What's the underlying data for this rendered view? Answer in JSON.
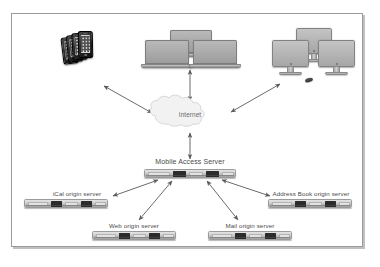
{
  "diagram": {
    "frame": {
      "border_color": "#9a9a9a",
      "background": "#ffffff"
    },
    "colors": {
      "arrow": "#5a5a5a",
      "cloud_fill": "#f2f2f2",
      "cloud_stroke": "#d0d0d0",
      "label_text": "#4a4a4a",
      "rack_dark_bay": "#2b2b2b"
    },
    "cloud": {
      "label": "Internet"
    },
    "mobile_access_server": {
      "label": "Mobile Access Server"
    },
    "clients": [
      {
        "name": "smartphone-stack",
        "icon": "smartphone-stack-icon",
        "count": 4
      },
      {
        "name": "laptop-group",
        "icon": "laptop-icon",
        "count": 3
      },
      {
        "name": "desktop-group",
        "icon": "imac-desktop-icon",
        "count": 3
      }
    ],
    "origin_servers": [
      {
        "id": "ical",
        "label": "iCal origin server"
      },
      {
        "id": "web",
        "label": "Web origin server"
      },
      {
        "id": "mail",
        "label": "Mail origin server"
      },
      {
        "id": "addressbook",
        "label": "Address Book origin server"
      }
    ],
    "connections": [
      {
        "from": "smartphone-stack",
        "to": "Internet",
        "style": "double-headed-arrow"
      },
      {
        "from": "laptop-group",
        "to": "Internet",
        "style": "double-headed-arrow"
      },
      {
        "from": "desktop-group",
        "to": "Internet",
        "style": "double-headed-arrow"
      },
      {
        "from": "Internet",
        "to": "Mobile Access Server",
        "style": "double-headed-arrow"
      },
      {
        "from": "Mobile Access Server",
        "to": "iCal origin server",
        "style": "double-headed-arrow"
      },
      {
        "from": "Mobile Access Server",
        "to": "Web origin server",
        "style": "double-headed-arrow"
      },
      {
        "from": "Mobile Access Server",
        "to": "Mail origin server",
        "style": "double-headed-arrow"
      },
      {
        "from": "Mobile Access Server",
        "to": "Address Book origin server",
        "style": "double-headed-arrow"
      }
    ]
  }
}
